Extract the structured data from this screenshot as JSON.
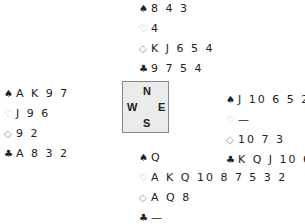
{
  "suits": {
    "spades": "♠",
    "hearts": "♡",
    "diamonds": "◇",
    "clubs": "♣"
  },
  "hands": {
    "north": {
      "spades": "8 4 3",
      "hearts": "4",
      "diamonds": "K J 6 5 4",
      "clubs": "9 7 5 4"
    },
    "west": {
      "spades": "A K 9 7",
      "hearts": "J 9 6",
      "diamonds": "9 2",
      "clubs": "A 8 3 2"
    },
    "east": {
      "spades": "J 10 6 5 2",
      "hearts": "—",
      "diamonds": "10 7 3",
      "clubs": "K Q J 10 6"
    },
    "south": {
      "spades": "Q",
      "hearts": "A K Q 10 8 7 5 3 2",
      "diamonds": "A Q 8",
      "clubs": "—"
    }
  },
  "compass": {
    "n": "N",
    "w": "W",
    "e": "E",
    "s": "S"
  }
}
